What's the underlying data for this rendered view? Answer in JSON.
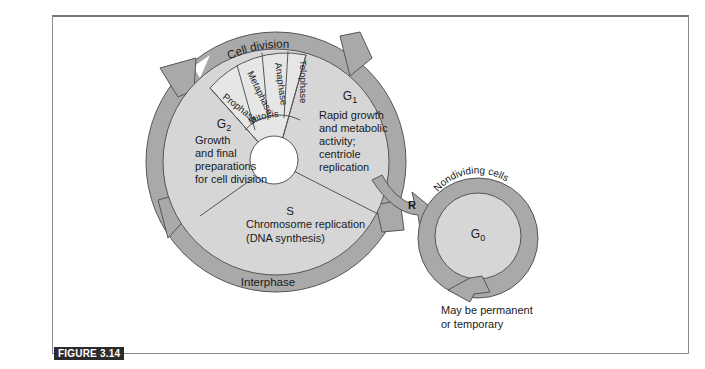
{
  "figure": {
    "label": "FIGURE 3.14"
  },
  "colors": {
    "ring_arrow": "#a9a9a9",
    "disc": "#d6d6d6",
    "mitosis": "#e4e4e4",
    "stroke": "#555555",
    "text": "#1a1a1a"
  },
  "cycle": {
    "outer_ring_labels": {
      "cell_division": "Cell division",
      "interphase": "Interphase"
    },
    "mitosis_label": "Mitosis",
    "mitosis_phases": [
      "Prophase",
      "Metaphase",
      "Anaphase",
      "Telophase"
    ],
    "g1": {
      "title": "G",
      "subscript": "1",
      "lines": [
        "Rapid growth",
        "and metabolic",
        "activity;",
        "centriole",
        "replication"
      ]
    },
    "g2": {
      "title": "G",
      "subscript": "2",
      "lines": [
        "Growth",
        "and final",
        "preparations",
        "for cell division"
      ]
    },
    "s": {
      "title": "S",
      "lines": [
        "Chromosome replication",
        "(DNA synthesis)"
      ]
    },
    "restriction_point": "R"
  },
  "g0": {
    "ring_label": "Nondividing cells",
    "title": "G",
    "subscript": "0",
    "note_lines": [
      "May be permanent",
      "or temporary"
    ]
  }
}
